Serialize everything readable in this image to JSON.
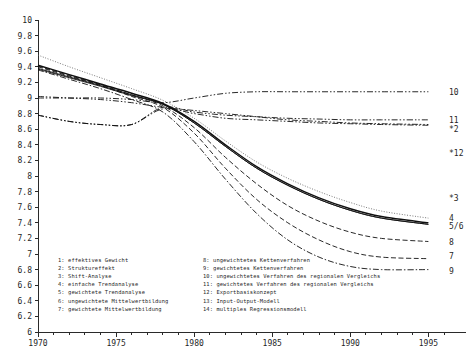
{
  "chart_data": {
    "type": "line",
    "title": "",
    "xlabel": "",
    "ylabel": "",
    "xlim": [
      1970,
      1996
    ],
    "ylim": [
      6,
      10
    ],
    "grid": false,
    "legend_position": "inside-bottom-left",
    "x_ticks_major": [
      "1970",
      "1975",
      "1980",
      "1985",
      "1990",
      "1995"
    ],
    "x_ticks_minor_step": 1,
    "y_ticks": [
      "10",
      "9.8",
      "9.6",
      "9.4",
      "9.2",
      "9",
      "8.8",
      "8.6",
      "8.4",
      "8.2",
      "8",
      "7.8",
      "7.6",
      "7.4",
      "7.2",
      "7",
      "6.8",
      "6.6",
      "6.4",
      "6.2",
      "6"
    ],
    "x": [
      1970,
      1972,
      1974,
      1976,
      1978,
      1980,
      1982,
      1984,
      1986,
      1988,
      1990,
      1992,
      1995
    ],
    "series": [
      {
        "name": "1",
        "label": "effektives Gewicht",
        "style": "solid-thick",
        "values": [
          9.42,
          9.3,
          9.18,
          9.06,
          8.93,
          8.7,
          8.4,
          8.12,
          7.9,
          7.72,
          7.58,
          7.48,
          7.4
        ]
      },
      {
        "name": "2",
        "label": "Struktureffekt",
        "style": "dash-dot-dot",
        "values": [
          8.78,
          8.7,
          8.66,
          8.66,
          8.86,
          8.8,
          8.74,
          8.72,
          8.7,
          8.68,
          8.67,
          8.66,
          8.65
        ]
      },
      {
        "name": "3",
        "label": "Shift-Analyse",
        "style": "dash-dot-dot",
        "values": [
          9.02,
          9.0,
          8.98,
          8.94,
          8.88,
          8.84,
          8.8,
          8.76,
          8.72,
          8.7,
          8.68,
          8.67,
          8.66
        ]
      },
      {
        "name": "4",
        "label": "einfache Trendanalyse",
        "style": "dotted",
        "values": [
          9.55,
          9.4,
          9.26,
          9.12,
          8.97,
          8.74,
          8.45,
          8.18,
          7.97,
          7.8,
          7.66,
          7.55,
          7.46
        ]
      },
      {
        "name": "5",
        "label": "gewichtete Trendanalyse",
        "style": "solid",
        "values": [
          9.37,
          9.26,
          9.15,
          9.03,
          8.92,
          8.68,
          8.38,
          8.1,
          7.88,
          7.7,
          7.56,
          7.46,
          7.38
        ]
      },
      {
        "name": "6",
        "label": "ungewichtete Mittelwertbildung",
        "style": "solid",
        "values": [
          9.38,
          9.27,
          9.16,
          9.04,
          8.92,
          8.68,
          8.38,
          8.1,
          7.88,
          7.7,
          7.56,
          7.46,
          7.38
        ]
      },
      {
        "name": "7",
        "label": "gewichtete Mittelwertbildung",
        "style": "dashed",
        "values": [
          9.4,
          9.28,
          9.16,
          9.02,
          8.88,
          8.55,
          8.1,
          7.7,
          7.4,
          7.18,
          7.03,
          6.96,
          6.94
        ]
      },
      {
        "name": "8",
        "label": "ungewichtetes Kettenverfahren",
        "style": "dashed",
        "values": [
          9.41,
          9.29,
          9.17,
          9.04,
          8.9,
          8.62,
          8.24,
          7.9,
          7.62,
          7.42,
          7.28,
          7.2,
          7.16
        ]
      },
      {
        "name": "9",
        "label": "gewichtetes Kettenverfahren",
        "style": "dash-dot",
        "values": [
          9.36,
          9.24,
          9.12,
          8.98,
          8.82,
          8.44,
          7.96,
          7.52,
          7.18,
          6.96,
          6.84,
          6.8,
          6.8
        ]
      },
      {
        "name": "10",
        "label": "ungewichtetes Verfahren des regionalen Vergleichs",
        "style": "dash-dot-dot",
        "values": [
          9.0,
          9.0,
          9.0,
          8.98,
          8.94,
          9.0,
          9.06,
          9.08,
          9.08,
          9.08,
          9.08,
          9.08,
          9.08
        ]
      },
      {
        "name": "11",
        "label": "gewichtetes Verfahren des regionalen Vergleichs",
        "style": "dash-dot-dot",
        "values": [
          8.78,
          8.7,
          8.66,
          8.66,
          8.88,
          8.82,
          8.78,
          8.76,
          8.74,
          8.73,
          8.72,
          8.72,
          8.72
        ]
      },
      {
        "name": "12",
        "label": "Exportbasiskonzept",
        "style": "marker-only",
        "values": [
          null,
          null,
          null,
          null,
          null,
          null,
          null,
          null,
          null,
          null,
          null,
          null,
          8.3
        ]
      },
      {
        "name": "13",
        "label": "Input-Output-Modell",
        "style": "marker-only",
        "values": [
          null,
          null,
          null,
          null,
          null,
          null,
          null,
          null,
          null,
          null,
          null,
          null,
          null
        ]
      },
      {
        "name": "14",
        "label": "multiples Regressionsmodell",
        "style": "marker-only",
        "values": [
          null,
          null,
          null,
          null,
          null,
          null,
          null,
          null,
          null,
          null,
          null,
          null,
          null
        ]
      }
    ],
    "right_labels": [
      {
        "text": "10",
        "value": 9.08
      },
      {
        "text": "11",
        "value": 8.72
      },
      {
        "text": "*2",
        "value": 8.6
      },
      {
        "text": "*12",
        "value": 8.3
      },
      {
        "text": "*3",
        "value": 7.72
      },
      {
        "text": "4",
        "value": 7.46
      },
      {
        "text": "5/6",
        "value": 7.36
      },
      {
        "text": "8",
        "value": 7.16
      },
      {
        "text": "7",
        "value": 6.98
      },
      {
        "text": "9",
        "value": 6.78
      }
    ],
    "legend_left": [
      "1: effektives Gewicht",
      "2: Struktureffekt",
      "3: Shift-Analyse",
      "4: einfache Trendanalyse",
      "5: gewichtete Trendanalyse",
      "6: ungewichtete Mittelwertbildung",
      "7: gewichtete Mittelwertbildung"
    ],
    "legend_right": [
      "8: ungewichtetes Kettenverfahren",
      "9: gewichtetes Kettenverfahren",
      "10: ungewichtetes Verfahren des regionalen Vergleichs",
      "11: gewichtetes Verfahren des regionalen Vergleichs",
      "12: Exportbasiskonzept",
      "13: Input-Output-Modell",
      "14: multiples Regressionsmodell"
    ],
    "colors": {
      "axis": "#2a2a2a",
      "curve": "#111111",
      "curve_light": "#5a5a5a",
      "text": "#1f1f1f",
      "background": "#ffffff"
    }
  }
}
